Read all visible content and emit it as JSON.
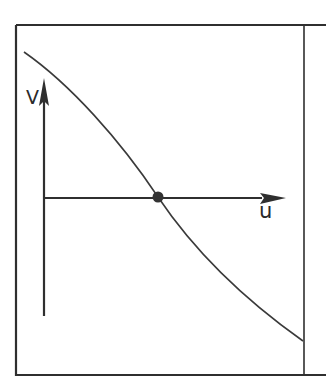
{
  "diagram": {
    "type": "phase-plane sketch",
    "axes": {
      "vertical": {
        "label": "V"
      },
      "horizontal": {
        "label": "u"
      }
    },
    "curve": {
      "description": "decreasing curve passing through the origin marker",
      "color": "#3a3a3a"
    },
    "marker": {
      "description": "filled dot at intersection of curve and horizontal axis",
      "color": "#333333"
    },
    "colors": {
      "line": "#2f2f2f",
      "background": "#ffffff"
    }
  }
}
